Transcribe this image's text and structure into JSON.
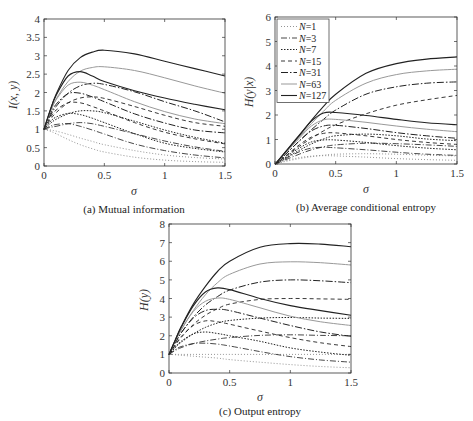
{
  "chart_data": [
    {
      "type": "line",
      "id": "a",
      "caption": "(a) Mutual information",
      "xlabel": "σ",
      "ylabel": "I(x, y)",
      "xlim": [
        0,
        1.5
      ],
      "ylim": [
        0,
        4
      ],
      "xticks": [
        "0",
        "0.5",
        "1",
        "1.5"
      ],
      "yticks": [
        "0",
        "0.5",
        "1",
        "1.5",
        "2",
        "2.5",
        "3",
        "3.5",
        "4"
      ],
      "grid": false,
      "x": [
        0,
        0.05,
        0.1,
        0.2,
        0.3,
        0.4,
        0.5,
        0.75,
        1.0,
        1.25,
        1.5
      ],
      "series": [
        {
          "name": "N=1 (a)",
          "values": [
            1.0,
            0.95,
            0.88,
            0.72,
            0.58,
            0.47,
            0.38,
            0.24,
            0.16,
            0.12,
            0.1
          ]
        },
        {
          "name": "N=1 (b)",
          "values": [
            1.0,
            0.98,
            0.95,
            0.86,
            0.76,
            0.67,
            0.58,
            0.42,
            0.3,
            0.23,
            0.19
          ]
        },
        {
          "name": "N=3 (a)",
          "values": [
            1.0,
            1.08,
            1.13,
            1.15,
            1.08,
            0.98,
            0.87,
            0.6,
            0.42,
            0.3,
            0.22
          ]
        },
        {
          "name": "N=3 (b)",
          "values": [
            1.0,
            1.05,
            1.08,
            1.15,
            1.18,
            1.15,
            1.08,
            0.88,
            0.68,
            0.52,
            0.4
          ]
        },
        {
          "name": "N=7 (a)",
          "values": [
            1.0,
            1.2,
            1.33,
            1.43,
            1.4,
            1.3,
            1.18,
            0.88,
            0.62,
            0.48,
            0.38
          ]
        },
        {
          "name": "N=7 (b)",
          "values": [
            1.0,
            1.15,
            1.27,
            1.42,
            1.5,
            1.5,
            1.45,
            1.22,
            0.98,
            0.78,
            0.62
          ]
        },
        {
          "name": "N=15 (a)",
          "values": [
            1.0,
            1.3,
            1.52,
            1.72,
            1.72,
            1.62,
            1.5,
            1.18,
            0.92,
            0.74,
            0.6
          ]
        },
        {
          "name": "N=15 (b)",
          "values": [
            1.0,
            1.25,
            1.45,
            1.72,
            1.85,
            1.88,
            1.84,
            1.62,
            1.38,
            1.18,
            1.08
          ]
        },
        {
          "name": "N=31 (a)",
          "values": [
            1.0,
            1.4,
            1.68,
            1.97,
            1.98,
            1.88,
            1.75,
            1.42,
            1.17,
            0.98,
            0.9
          ]
        },
        {
          "name": "N=31 (b)",
          "values": [
            1.0,
            1.35,
            1.62,
            1.98,
            2.18,
            2.25,
            2.22,
            2.02,
            1.75,
            1.5,
            1.2
          ]
        },
        {
          "name": "N=63 (a)",
          "values": [
            1.0,
            1.45,
            1.8,
            2.2,
            2.28,
            2.2,
            2.08,
            1.75,
            1.48,
            1.28,
            1.15
          ]
        },
        {
          "name": "N=63 (b)",
          "values": [
            1.0,
            1.45,
            1.82,
            2.3,
            2.58,
            2.68,
            2.7,
            2.6,
            2.4,
            2.18,
            1.98
          ]
        },
        {
          "name": "N=127 (a)",
          "values": [
            1.0,
            1.5,
            1.92,
            2.45,
            2.57,
            2.45,
            2.3,
            2.05,
            1.85,
            1.68,
            1.53
          ]
        },
        {
          "name": "N=127 (b)",
          "values": [
            1.0,
            1.5,
            1.95,
            2.6,
            2.95,
            3.1,
            3.15,
            3.05,
            2.85,
            2.65,
            2.45
          ]
        }
      ]
    },
    {
      "type": "line",
      "id": "b",
      "caption": "(b) Average conditional entropy",
      "xlabel": "σ",
      "ylabel": "H(y|x)",
      "xlim": [
        0,
        1.5
      ],
      "ylim": [
        0,
        6
      ],
      "xticks": [
        "0",
        "0.5",
        "1",
        "1.5"
      ],
      "yticks": [
        "0",
        "1",
        "2",
        "3",
        "4",
        "5",
        "6"
      ],
      "grid": false,
      "legend": {
        "position": "upper left",
        "entries": [
          "N=1",
          "N=3",
          "N=7",
          "N=15",
          "N=31",
          "N=63",
          "N=127"
        ]
      },
      "x": [
        0,
        0.05,
        0.1,
        0.2,
        0.3,
        0.4,
        0.5,
        0.75,
        1.0,
        1.25,
        1.5
      ],
      "series": [
        {
          "name": "N=1 (a)",
          "values": [
            0,
            0.08,
            0.15,
            0.26,
            0.32,
            0.34,
            0.33,
            0.28,
            0.22,
            0.18,
            0.15
          ]
        },
        {
          "name": "N=1 (b)",
          "values": [
            0,
            0.06,
            0.12,
            0.22,
            0.3,
            0.36,
            0.4,
            0.42,
            0.4,
            0.36,
            0.33
          ]
        },
        {
          "name": "N=3 (a)",
          "values": [
            0,
            0.12,
            0.25,
            0.5,
            0.65,
            0.68,
            0.66,
            0.58,
            0.48,
            0.4,
            0.35
          ]
        },
        {
          "name": "N=3 (b)",
          "values": [
            0,
            0.1,
            0.2,
            0.4,
            0.58,
            0.7,
            0.78,
            0.85,
            0.83,
            0.78,
            0.72
          ]
        },
        {
          "name": "N=7 (a)",
          "values": [
            0,
            0.15,
            0.32,
            0.65,
            0.9,
            0.98,
            0.98,
            0.88,
            0.75,
            0.65,
            0.58
          ]
        },
        {
          "name": "N=7 (b)",
          "values": [
            0,
            0.14,
            0.28,
            0.56,
            0.82,
            1.02,
            1.15,
            1.22,
            1.15,
            1.02,
            0.95
          ]
        },
        {
          "name": "N=15 (a)",
          "values": [
            0,
            0.18,
            0.38,
            0.78,
            1.1,
            1.25,
            1.27,
            1.15,
            1.0,
            0.88,
            0.8
          ]
        },
        {
          "name": "N=15 (b)",
          "values": [
            0,
            0.18,
            0.36,
            0.72,
            1.05,
            1.35,
            1.6,
            2.05,
            2.4,
            2.62,
            2.8
          ]
        },
        {
          "name": "N=31 (a)",
          "values": [
            0,
            0.22,
            0.46,
            0.94,
            1.35,
            1.55,
            1.58,
            1.45,
            1.28,
            1.15,
            1.05
          ]
        },
        {
          "name": "N=31 (b)",
          "values": [
            0,
            0.22,
            0.46,
            0.94,
            1.4,
            1.82,
            2.2,
            2.85,
            3.15,
            3.3,
            3.35
          ]
        },
        {
          "name": "N=63 (a)",
          "values": [
            0,
            0.25,
            0.52,
            1.05,
            1.55,
            1.8,
            1.82,
            1.7,
            1.55,
            1.42,
            1.32
          ]
        },
        {
          "name": "N=63 (b)",
          "values": [
            0,
            0.26,
            0.54,
            1.1,
            1.65,
            2.15,
            2.6,
            3.3,
            3.65,
            3.8,
            3.87
          ]
        },
        {
          "name": "N=127 (a)",
          "values": [
            0,
            0.28,
            0.57,
            1.16,
            1.75,
            2.08,
            2.1,
            1.98,
            1.82,
            1.68,
            1.6
          ]
        },
        {
          "name": "N=127 (b)",
          "values": [
            0,
            0.28,
            0.58,
            1.18,
            1.78,
            2.35,
            2.85,
            3.7,
            4.1,
            4.28,
            4.37
          ]
        }
      ]
    },
    {
      "type": "line",
      "id": "c",
      "caption": "(c) Output entropy",
      "xlabel": "σ",
      "ylabel": "H(y)",
      "xlim": [
        0,
        1.5
      ],
      "ylim": [
        0,
        8
      ],
      "xticks": [
        "0",
        "0.5",
        "1",
        "1.5"
      ],
      "yticks": [
        "0",
        "1",
        "2",
        "3",
        "4",
        "5",
        "6",
        "7",
        "8"
      ],
      "grid": false,
      "x": [
        0,
        0.05,
        0.1,
        0.2,
        0.3,
        0.4,
        0.5,
        0.75,
        1.0,
        1.25,
        1.5
      ],
      "series": [
        {
          "name": "N=1 (a)",
          "values": [
            1.0,
            1.0,
            1.0,
            1.0,
            1.0,
            1.0,
            1.0,
            1.0,
            1.0,
            1.0,
            1.0
          ]
        },
        {
          "name": "N=1 (b)",
          "values": [
            1.0,
            0.98,
            0.95,
            0.9,
            0.85,
            0.8,
            0.72,
            0.58,
            0.45,
            0.35,
            0.28
          ]
        },
        {
          "name": "N=3 (a)",
          "values": [
            1.0,
            1.25,
            1.42,
            1.58,
            1.6,
            1.55,
            1.45,
            1.15,
            0.88,
            0.7,
            0.58
          ]
        },
        {
          "name": "N=3 (b)",
          "values": [
            1.0,
            1.2,
            1.36,
            1.58,
            1.72,
            1.82,
            1.9,
            2.02,
            2.05,
            2.02,
            2.0
          ]
        },
        {
          "name": "N=7 (a)",
          "values": [
            1.0,
            1.4,
            1.7,
            2.1,
            2.2,
            2.12,
            2.0,
            1.7,
            1.35,
            1.12,
            0.95
          ]
        },
        {
          "name": "N=7 (b)",
          "values": [
            1.0,
            1.35,
            1.65,
            2.1,
            2.45,
            2.68,
            2.82,
            2.95,
            2.98,
            2.95,
            2.93
          ]
        },
        {
          "name": "N=15 (a)",
          "values": [
            1.0,
            1.5,
            1.95,
            2.55,
            2.8,
            2.75,
            2.62,
            2.25,
            1.9,
            1.62,
            1.42
          ]
        },
        {
          "name": "N=15 (b)",
          "values": [
            1.0,
            1.48,
            1.9,
            2.6,
            3.1,
            3.45,
            3.7,
            3.95,
            4.0,
            3.98,
            3.95
          ]
        },
        {
          "name": "N=31 (a)",
          "values": [
            1.0,
            1.6,
            2.15,
            2.95,
            3.35,
            3.42,
            3.35,
            2.95,
            2.55,
            2.2,
            1.97
          ]
        },
        {
          "name": "N=31 (b)",
          "values": [
            1.0,
            1.6,
            2.15,
            3.0,
            3.65,
            4.1,
            4.45,
            4.88,
            5.0,
            4.95,
            4.85
          ]
        },
        {
          "name": "N=63 (a)",
          "values": [
            1.0,
            1.68,
            2.3,
            3.3,
            3.85,
            4.02,
            3.95,
            3.5,
            3.05,
            2.75,
            2.55
          ]
        },
        {
          "name": "N=63 (b)",
          "values": [
            1.0,
            1.68,
            2.32,
            3.35,
            4.2,
            4.85,
            5.3,
            5.85,
            5.97,
            5.92,
            5.8
          ]
        },
        {
          "name": "N=127 (a)",
          "values": [
            1.0,
            1.75,
            2.45,
            3.6,
            4.35,
            4.57,
            4.48,
            4.0,
            3.62,
            3.35,
            3.1
          ]
        },
        {
          "name": "N=127 (b)",
          "values": [
            1.0,
            1.75,
            2.48,
            3.7,
            4.65,
            5.45,
            6.0,
            6.75,
            6.95,
            6.92,
            6.78
          ]
        }
      ]
    }
  ],
  "styles": {
    "N=1": {
      "dash": "1,2",
      "color": "#888888",
      "width": 0.9
    },
    "N=3": {
      "dash": "6,2,1,2",
      "color": "#333333",
      "width": 0.9
    },
    "N=7": {
      "dash": "1.5,1.5",
      "color": "#222222",
      "width": 1.0
    },
    "N=15": {
      "dash": "4,3",
      "color": "#222222",
      "width": 0.9
    },
    "N=31": {
      "dash": "7,2,1.5,2",
      "color": "#222222",
      "width": 1.0
    },
    "N=63": {
      "dash": "",
      "color": "#999999",
      "width": 1.0
    },
    "N=127": {
      "dash": "",
      "color": "#222222",
      "width": 1.1
    }
  }
}
